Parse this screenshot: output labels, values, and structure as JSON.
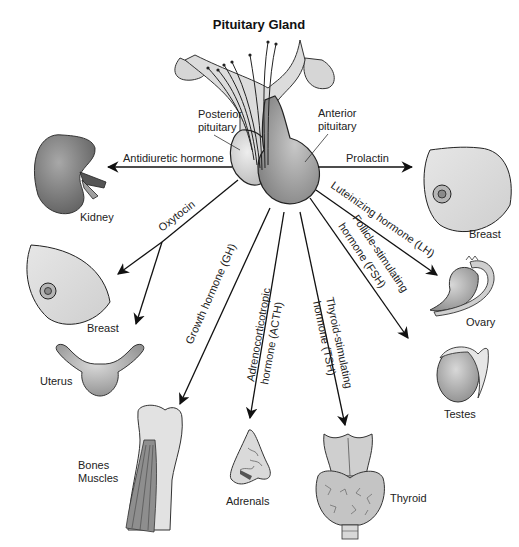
{
  "title": "Pituitary Gland",
  "gland_parts": {
    "posterior": "Posterior\npituitary",
    "posterior_line1": "Posterior",
    "posterior_line2": "pituitary",
    "anterior_line1": "Anterior",
    "anterior_line2": "pituitary"
  },
  "hormones": {
    "adh": "Antidiuretic hormone",
    "prolactin": "Prolactin",
    "lh": "Luteinizing hormone (LH)",
    "fsh_line1": "Follicle-stimulating",
    "fsh_line2": "hormone (FSH)",
    "oxytocin": "Oxytocin",
    "gh": "Growth hormone (GH)",
    "acth_line1": "Adrenocorticotropic",
    "acth_line2": "hormone (ACTH)",
    "tsh_line1": "Thyroid-stimulating",
    "tsh_line2": "hormone (TSH)"
  },
  "targets": {
    "kidney": "Kidney",
    "breast_left": "Breast",
    "uterus": "Uterus",
    "bones_line1": "Bones",
    "bones_line2": "Muscles",
    "adrenals": "Adrenals",
    "thyroid": "Thyroid",
    "testes": "Testes",
    "ovary": "Ovary",
    "breast_right": "Breast"
  },
  "colors": {
    "background": "#ffffff",
    "posterior_fill": "#d4d4d4",
    "anterior_fill": "#9a9a9a",
    "organ_dark": "#808080",
    "organ_light": "#dedede",
    "line": "#111111"
  }
}
